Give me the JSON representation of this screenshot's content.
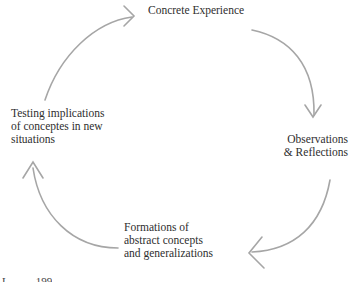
{
  "diagram": {
    "type": "cycle",
    "stroke_color": "#a6a6a6",
    "nodes": [
      {
        "id": "concrete",
        "lines": [
          "Concrete Experience"
        ]
      },
      {
        "id": "observations",
        "lines": [
          "Observations",
          "& Reflections"
        ]
      },
      {
        "id": "formations",
        "lines": [
          "Formations of",
          "abstract concepts",
          "and generalizations"
        ]
      },
      {
        "id": "testing",
        "lines": [
          "Testing implications",
          "of conceptes in new",
          "situations"
        ]
      }
    ],
    "edges": [
      {
        "from": "concrete",
        "to": "observations"
      },
      {
        "from": "observations",
        "to": "formations"
      },
      {
        "from": "formations",
        "to": "testing"
      },
      {
        "from": "testing",
        "to": "concrete"
      }
    ]
  },
  "footer": {
    "citation_fragment": "L          199"
  }
}
